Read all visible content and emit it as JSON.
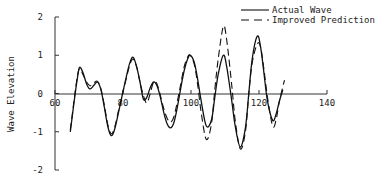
{
  "chart_data": {
    "type": "line",
    "title": "",
    "xlabel": "",
    "ylabel": "Wave Elevation",
    "xlim": [
      60,
      140
    ],
    "ylim": [
      -2,
      2
    ],
    "x_ticks": [
      "60",
      "80",
      "100",
      "120",
      "140"
    ],
    "y_ticks": [
      "2",
      "1",
      "0",
      "-1",
      "-2"
    ],
    "grid": false,
    "legend_position": "top-right",
    "series": [
      {
        "name": "Actual Wave",
        "style": "solid",
        "x": [
          64.5,
          65.5,
          66.5,
          67.2,
          68.2,
          69.3,
          70.3,
          71.5,
          72.5,
          73.5,
          74.5,
          75.5,
          76.5,
          77.5,
          78.8,
          80,
          81,
          82,
          83,
          84,
          85,
          86,
          87,
          88,
          89,
          90,
          91,
          92,
          93,
          94,
          95,
          96,
          97,
          98,
          99,
          99.8,
          101,
          102,
          103,
          104.5,
          106,
          107,
          108,
          109.5,
          110.5,
          112,
          113,
          114.5,
          116,
          117,
          118,
          119.5,
          120.5,
          121.5,
          122.5,
          124,
          125,
          126,
          127
        ],
        "y": [
          -1.0,
          -0.3,
          0.35,
          0.68,
          0.55,
          0.25,
          0.12,
          0.22,
          0.3,
          0.1,
          -0.35,
          -0.85,
          -1.1,
          -0.95,
          -0.45,
          0.05,
          0.45,
          0.8,
          0.95,
          0.7,
          0.3,
          -0.15,
          -0.1,
          0.15,
          0.3,
          0.2,
          -0.1,
          -0.5,
          -0.8,
          -0.9,
          -0.75,
          -0.35,
          0.15,
          0.6,
          0.9,
          1.0,
          0.8,
          0.35,
          -0.2,
          -0.85,
          -0.7,
          -0.1,
          0.5,
          1.0,
          0.7,
          -0.2,
          -0.85,
          -1.4,
          -0.9,
          0.0,
          0.9,
          1.5,
          1.2,
          0.5,
          -0.2,
          -0.7,
          -0.55,
          -0.2,
          0.1
        ]
      },
      {
        "name": "Improved Prediction",
        "style": "dashed",
        "x": [
          64.5,
          65.5,
          66.5,
          67.2,
          68.2,
          69.3,
          70.3,
          71.5,
          72.5,
          73.5,
          74.5,
          75.5,
          76.5,
          77.5,
          78.8,
          80,
          81,
          82,
          83,
          84,
          85,
          86,
          87,
          88,
          89,
          90,
          91,
          92,
          93,
          94,
          95,
          96,
          97,
          98,
          99,
          99.8,
          101,
          102,
          103,
          104.5,
          106,
          107,
          108,
          109.5,
          110.5,
          112,
          113,
          114.5,
          116,
          117,
          118,
          119.5,
          120.5,
          121.5,
          122.5,
          124,
          125,
          126,
          127.5
        ],
        "y": [
          -0.95,
          -0.25,
          0.4,
          0.65,
          0.5,
          0.3,
          0.2,
          0.28,
          0.32,
          0.12,
          -0.3,
          -0.8,
          -1.05,
          -0.9,
          -0.4,
          0.05,
          0.4,
          0.75,
          0.9,
          0.7,
          0.3,
          -0.05,
          -0.25,
          0.0,
          0.3,
          0.25,
          -0.05,
          -0.4,
          -0.65,
          -0.75,
          -0.6,
          -0.2,
          0.25,
          0.7,
          0.95,
          1.0,
          0.75,
          0.2,
          -0.5,
          -1.2,
          -0.8,
          0.1,
          0.9,
          1.75,
          1.4,
          0.2,
          -0.7,
          -1.45,
          -1.0,
          0.0,
          0.8,
          1.3,
          1.2,
          0.6,
          -0.1,
          -0.85,
          -0.7,
          -0.2,
          0.35
        ]
      }
    ]
  },
  "legend": {
    "items": [
      {
        "label": "Actual Wave",
        "style": "solid"
      },
      {
        "label": "Improved Prediction",
        "style": "dashed"
      }
    ]
  },
  "axes": {
    "ylabel": "Wave Elevation",
    "x_ticks": [
      "60",
      "80",
      "100",
      "120",
      "140"
    ],
    "y_ticks": [
      "2",
      "1",
      "0",
      "-1",
      "-2"
    ]
  },
  "colors": {
    "line": "#111111",
    "axis": "#333333",
    "background": "#ffffff"
  }
}
